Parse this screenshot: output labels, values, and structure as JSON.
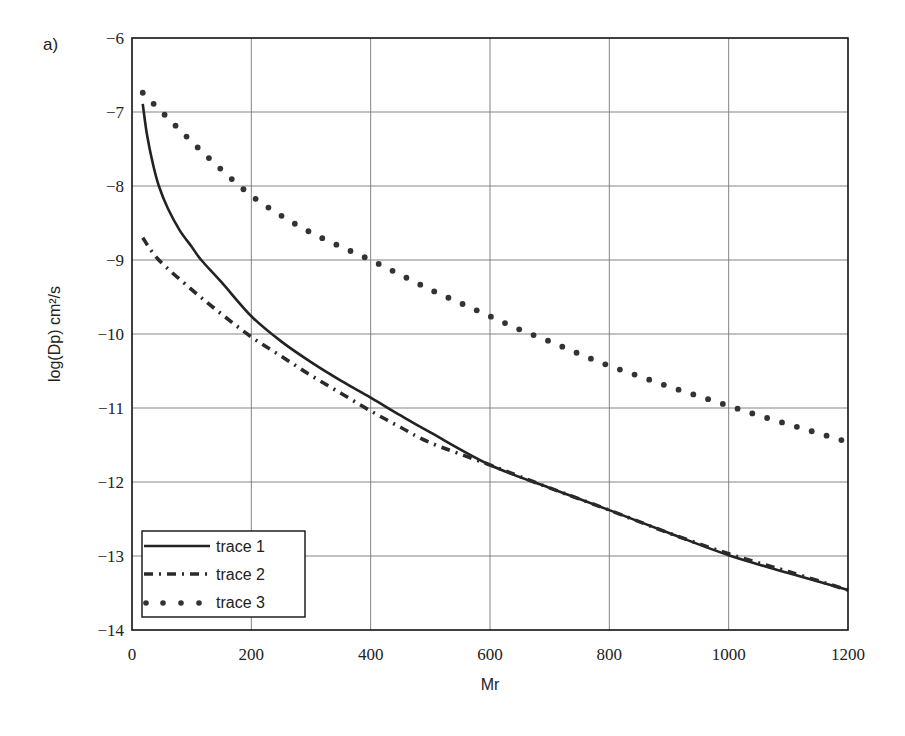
{
  "panel_label": "a)",
  "chart_data": {
    "type": "line",
    "title": "",
    "xlabel": "Mr",
    "ylabel": "log(Dp)   cm²/s",
    "xlim": [
      0,
      1200
    ],
    "ylim": [
      -14,
      -6
    ],
    "grid": true,
    "legend_position": "lower-left",
    "x_ticks": [
      0,
      200,
      400,
      600,
      800,
      1000,
      1200
    ],
    "y_ticks": [
      -6,
      -7,
      -8,
      -9,
      -10,
      -11,
      -12,
      -13,
      -14
    ],
    "x_tick_labels": [
      "0",
      "200",
      "400",
      "600",
      "800",
      "1000",
      "1200"
    ],
    "y_tick_labels": [
      "−6",
      "−7",
      "−8",
      "−9",
      "−10",
      "−11",
      "−12",
      "−13",
      "−14"
    ],
    "series": [
      {
        "name": "trace 1",
        "style": "solid",
        "x": [
          18,
          25,
          35,
          45,
          60,
          80,
          100,
          116,
          150,
          200,
          250,
          300,
          350,
          400,
          450,
          500,
          600,
          700,
          800,
          900,
          1000,
          1100,
          1200
        ],
        "y": [
          -6.89,
          -7.3,
          -7.7,
          -8.0,
          -8.3,
          -8.6,
          -8.82,
          -9.0,
          -9.3,
          -9.76,
          -10.1,
          -10.38,
          -10.63,
          -10.86,
          -11.1,
          -11.33,
          -11.77,
          -12.08,
          -12.38,
          -12.69,
          -12.99,
          -13.23,
          -13.46
        ]
      },
      {
        "name": "trace 2",
        "style": "dash-dot",
        "x": [
          18,
          45,
          100,
          150,
          200,
          250,
          300,
          350,
          400,
          450,
          500,
          600,
          700,
          800,
          900,
          1000,
          1100,
          1200
        ],
        "y": [
          -8.7,
          -9.0,
          -9.4,
          -9.73,
          -10.04,
          -10.3,
          -10.56,
          -10.8,
          -11.04,
          -11.26,
          -11.47,
          -11.77,
          -12.08,
          -12.38,
          -12.69,
          -12.97,
          -13.21,
          -13.46
        ]
      },
      {
        "name": "trace 3",
        "style": "dotted",
        "x": [
          18,
          50,
          100,
          150,
          200,
          250,
          300,
          350,
          400,
          450,
          500,
          550,
          600,
          650,
          700,
          750,
          800,
          850,
          900,
          950,
          1000,
          1050,
          1100,
          1150,
          1200
        ],
        "y": [
          -6.74,
          -7.0,
          -7.4,
          -7.78,
          -8.13,
          -8.4,
          -8.63,
          -8.82,
          -9.0,
          -9.2,
          -9.4,
          -9.58,
          -9.76,
          -9.94,
          -10.1,
          -10.27,
          -10.43,
          -10.57,
          -10.71,
          -10.84,
          -10.97,
          -11.1,
          -11.22,
          -11.34,
          -11.46
        ]
      }
    ]
  }
}
